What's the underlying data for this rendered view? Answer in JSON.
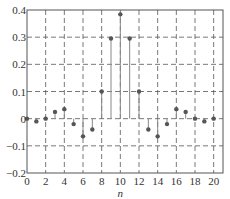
{
  "chart_data": {
    "type": "stem",
    "title": "",
    "xlabel": "n",
    "ylabel": "",
    "x": [
      0,
      1,
      2,
      3,
      4,
      5,
      6,
      7,
      8,
      9,
      10,
      11,
      12,
      13,
      14,
      15,
      16,
      17,
      18,
      19,
      20
    ],
    "values": [
      0,
      -0.01,
      0,
      0.025,
      0.035,
      -0.02,
      -0.065,
      -0.04,
      0.1,
      0.295,
      0.384,
      0.295,
      0.1,
      -0.04,
      -0.065,
      -0.02,
      0.035,
      0.025,
      0,
      -0.01,
      0
    ],
    "xlim": [
      0,
      21
    ],
    "ylim": [
      -0.2,
      0.4
    ],
    "xticks": [
      "0",
      "2",
      "4",
      "6",
      "8",
      "10",
      "12",
      "14",
      "16",
      "18",
      "20"
    ],
    "yticks": [
      "-0.2",
      "-0.1",
      "0",
      "0.1",
      "0.2",
      "0.3",
      "0.4"
    ],
    "grid": true,
    "grid_style": "dashed",
    "legend": null
  },
  "style": {
    "stem_color": "#888888",
    "marker_color": "#555555",
    "grid_color": "#555555",
    "axis_color": "#555555"
  }
}
